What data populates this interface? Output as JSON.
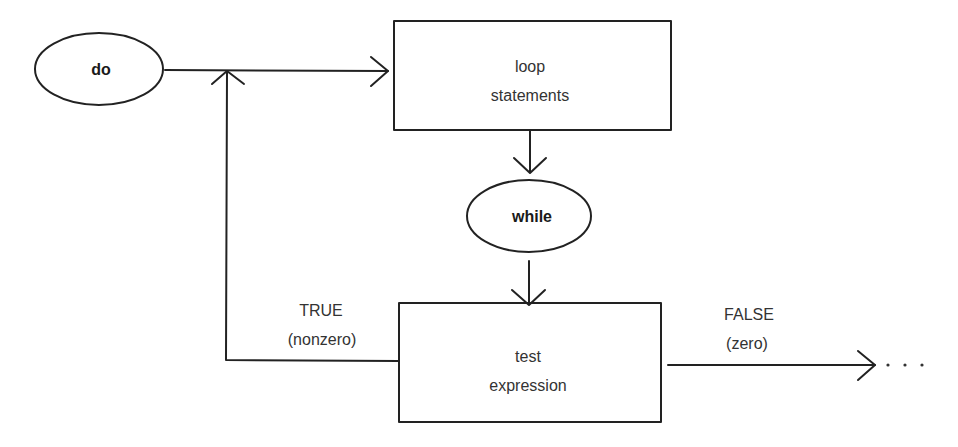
{
  "diagram": {
    "type": "flowchart",
    "title_hint": "do-while loop",
    "nodes": {
      "do": {
        "shape": "ellipse",
        "label": "do"
      },
      "loop": {
        "shape": "rectangle",
        "line1": "loop",
        "line2": "statements"
      },
      "while": {
        "shape": "ellipse",
        "label": "while"
      },
      "test": {
        "shape": "rectangle",
        "line1": "test",
        "line2": "expression"
      }
    },
    "edges": {
      "true_branch": {
        "line1": "TRUE",
        "line2": "(nonzero)"
      },
      "false_branch": {
        "line1": "FALSE",
        "line2": "(zero)",
        "continuation": ". . ."
      }
    },
    "colors": {
      "stroke": "#222222",
      "text": "#333333",
      "background": "#ffffff"
    }
  }
}
